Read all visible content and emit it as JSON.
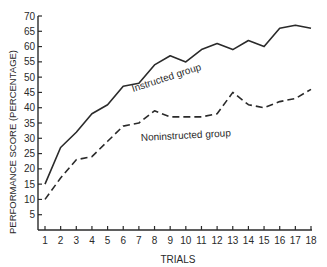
{
  "chart_data": {
    "type": "line",
    "title": "",
    "xlabel": "TRIALS",
    "ylabel": "PERFORMANCE SCORE (PERCENTAGE)",
    "x": [
      1,
      2,
      3,
      4,
      5,
      6,
      7,
      8,
      9,
      10,
      11,
      12,
      13,
      14,
      15,
      16,
      17,
      18
    ],
    "xticks": [
      "1",
      "2",
      "3",
      "4",
      "5",
      "6",
      "7",
      "8",
      "9",
      "10",
      "11",
      "12",
      "13",
      "14",
      "15",
      "16",
      "17",
      "18"
    ],
    "yticks": [
      "5",
      "10",
      "15",
      "20",
      "25",
      "30",
      "35",
      "40",
      "45",
      "50",
      "55",
      "60",
      "65",
      "70"
    ],
    "ylim": [
      0,
      70
    ],
    "xlim": [
      1,
      18
    ],
    "grid": false,
    "legend": "inline labels on lines",
    "series": [
      {
        "name": "Instructed group",
        "style": "solid",
        "values": [
          15,
          27,
          32,
          38,
          41,
          47,
          48,
          54,
          57,
          55,
          59,
          61,
          59,
          62,
          60,
          66,
          67,
          66
        ]
      },
      {
        "name": "Noninstructed group",
        "style": "dashed",
        "values": [
          10,
          17,
          23,
          24,
          29,
          34,
          35,
          39,
          37,
          37,
          37,
          38,
          45,
          41,
          40,
          42,
          43,
          46
        ]
      }
    ],
    "annotations": [
      {
        "text": "Instructed group",
        "near_x": 5,
        "near_y": 54
      },
      {
        "text": "Noninstructed group",
        "near_x": 10,
        "near_y": 30
      }
    ]
  },
  "colors": {
    "line": "#2a2a2a",
    "background": "#ffffff"
  }
}
